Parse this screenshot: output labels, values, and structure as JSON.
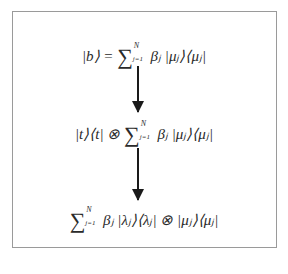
{
  "diagram": {
    "step1": {
      "lhs": "|b⟩ =",
      "sum_upper": "N",
      "sum_lower": "j=1",
      "rhs": "βⱼ |μⱼ⟩⟨μⱼ|"
    },
    "step2": {
      "lhs": "|t⟩⟨t| ⊗",
      "sum_upper": "N",
      "sum_lower": "j=1",
      "rhs": "βⱼ |μⱼ⟩⟨μⱼ|"
    },
    "step3": {
      "lhs": "",
      "sum_upper": "N",
      "sum_lower": "j=1",
      "rhs": "βⱼ |λⱼ⟩⟨λⱼ| ⊗ |μⱼ⟩⟨μⱼ|"
    },
    "arrows": [
      {
        "from": "step1",
        "to": "step2"
      },
      {
        "from": "step2",
        "to": "step3"
      }
    ],
    "colors": {
      "border": "#9a9a9a",
      "ink": "#1a1a1a"
    }
  }
}
